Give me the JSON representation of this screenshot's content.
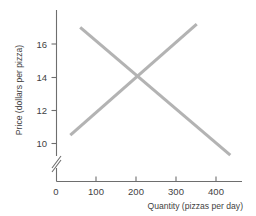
{
  "chart_data": {
    "type": "line",
    "title": "",
    "xlabel": "Quantity (pizzas per day)",
    "ylabel": "Price (dollars per pizza)",
    "xlim": [
      0,
      465
    ],
    "ylim": [
      9,
      17.6
    ],
    "xticks": [
      0,
      100,
      200,
      300,
      400
    ],
    "xtick_labels": [
      "0",
      "100",
      "200",
      "300",
      "400"
    ],
    "yticks": [
      10,
      12,
      14,
      16
    ],
    "ytick_labels": [
      "10",
      "12",
      "14",
      "16"
    ],
    "grid": false,
    "legend": "none",
    "y_axis_break": true,
    "line_color": "#b3b3b3",
    "axis_color": "#6e6e6e",
    "background": "#ffffff",
    "series": [
      {
        "name": "demand",
        "direction": "downward",
        "x": [
          60,
          440
        ],
        "y": [
          17.0,
          9.3
        ]
      },
      {
        "name": "supply",
        "direction": "upward",
        "x": [
          35,
          355
        ],
        "y": [
          10.5,
          17.2
        ]
      }
    ],
    "equilibrium": {
      "quantity": 200,
      "price": 14
    }
  },
  "labels": {
    "tick_0": "0",
    "tick_100": "100",
    "tick_200": "200",
    "tick_300": "300",
    "tick_400": "400",
    "tick_10": "10",
    "tick_12": "12",
    "tick_14": "14",
    "tick_16": "16"
  }
}
